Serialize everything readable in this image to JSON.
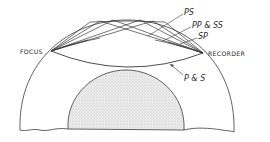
{
  "diagram": {
    "type": "seismic-ray-paths",
    "labels": {
      "focus": "FOCUS",
      "recorder": "RECORDER",
      "ps": "PS",
      "pp_ss": "PP & SS",
      "sp": "SP",
      "p_s": "P & S"
    },
    "colors": {
      "line": "#3a3a3a",
      "core_fill": "#e4e4e4",
      "background": "#ffffff"
    }
  }
}
